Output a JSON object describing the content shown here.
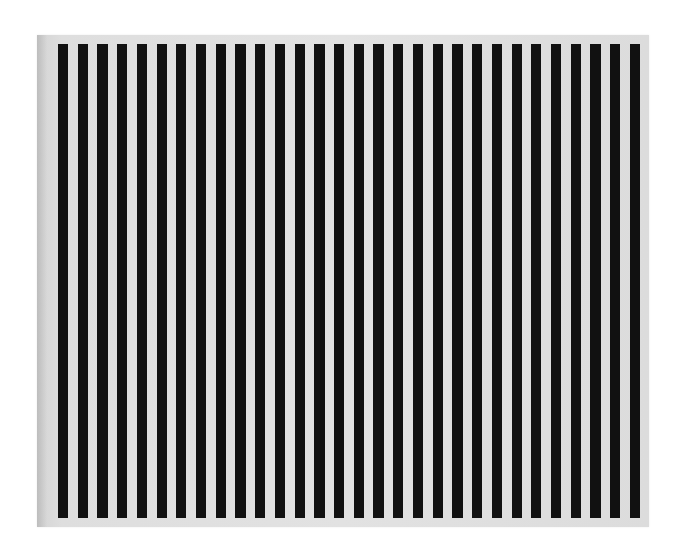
{
  "artwork": {
    "description": "Painting of vertical alternating black and white stripes on a light canvas",
    "stripe_count": 30,
    "colors": {
      "stripe": "#111111",
      "ground": "#e0e0e0",
      "background": "#ffffff"
    }
  }
}
